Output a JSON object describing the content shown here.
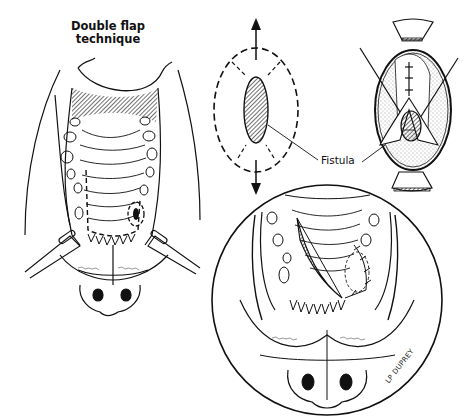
{
  "figure": {
    "title_line1": "Double flap",
    "title_line2": "technique",
    "labels": {
      "fistula": "Fistula"
    },
    "signature": "LP DUPREY",
    "panels": [
      {
        "id": "overview",
        "description": "Palate view with dashed flap outline around fistula, retractors at mouth corners"
      },
      {
        "id": "incision-schematic",
        "description": "Oval fistula with dashed incision outline and opposing arrows"
      },
      {
        "id": "flap-detail",
        "description": "Inner flap turned over fistula and sutured, with oral mucosa stippling"
      },
      {
        "id": "closure-magnified",
        "description": "Circular magnified view of rotated palatal flap sutured over fistula"
      }
    ],
    "colors": {
      "ink": "#111111",
      "background": "#ffffff"
    }
  }
}
